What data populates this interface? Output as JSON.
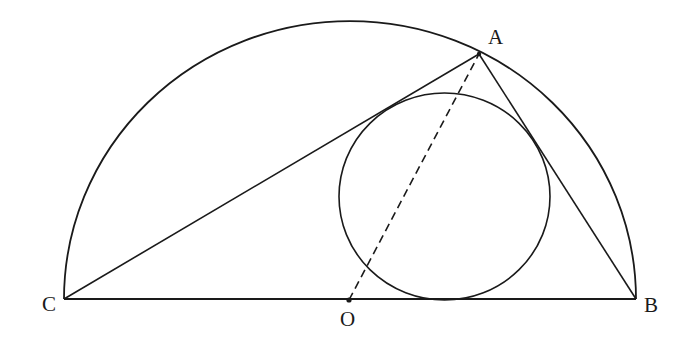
{
  "diagram": {
    "type": "geometry",
    "colors": {
      "stroke": "#1a1a1a",
      "background": "#ffffff"
    },
    "points": {
      "A": {
        "label": "A",
        "x": 479,
        "y": 54
      },
      "B": {
        "label": "B",
        "x": 636,
        "y": 299
      },
      "C": {
        "label": "C",
        "x": 64,
        "y": 299
      },
      "O": {
        "label": "O",
        "x": 349,
        "y": 300
      }
    },
    "semicircle": {
      "center": "O",
      "rx": 286,
      "ry": 278
    },
    "inner_circle": {
      "cx": 444.5,
      "cy": 196.5,
      "rx": 105.5,
      "ry": 103.5
    },
    "segments": [
      {
        "from": "C",
        "to": "B",
        "style": "solid"
      },
      {
        "from": "C",
        "to": "A",
        "style": "solid"
      },
      {
        "from": "A",
        "to": "B",
        "style": "solid"
      },
      {
        "from": "O",
        "to": "A",
        "style": "dashed"
      }
    ]
  }
}
